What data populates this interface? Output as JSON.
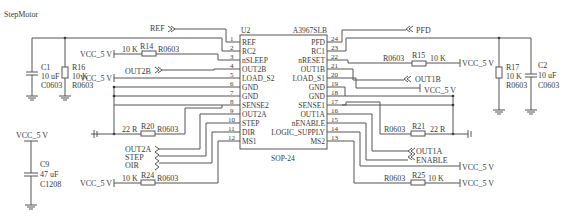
{
  "title": "StepMotor",
  "chip": {
    "ref": "U2",
    "part": "A3967SLB",
    "package": "SOP-24",
    "left_pins": [
      {
        "num": "1",
        "name": "REF"
      },
      {
        "num": "2",
        "name": "RC2"
      },
      {
        "num": "3",
        "name": "nSLEEP"
      },
      {
        "num": "4",
        "name": "OUT2B"
      },
      {
        "num": "5",
        "name": "LOAD_S2"
      },
      {
        "num": "6",
        "name": "GND"
      },
      {
        "num": "7",
        "name": "GND"
      },
      {
        "num": "8",
        "name": "SENSE2"
      },
      {
        "num": "9",
        "name": "OUT2A"
      },
      {
        "num": "10",
        "name": "STEP"
      },
      {
        "num": "11",
        "name": "DIR"
      },
      {
        "num": "12",
        "name": "MS1"
      }
    ],
    "right_pins": [
      {
        "num": "24",
        "name": "PFD"
      },
      {
        "num": "23",
        "name": "RC1"
      },
      {
        "num": "22",
        "name": "nRESET"
      },
      {
        "num": "21",
        "name": "OUT1B"
      },
      {
        "num": "20",
        "name": "LOAD_S1"
      },
      {
        "num": "19",
        "name": "GND"
      },
      {
        "num": "18",
        "name": "GND"
      },
      {
        "num": "17",
        "name": "SENSE1"
      },
      {
        "num": "16",
        "name": "OUT1A"
      },
      {
        "num": "15",
        "name": "nENABLE"
      },
      {
        "num": "14",
        "name": "LOGIC_SUPPLY"
      },
      {
        "num": "13",
        "name": "MS2"
      }
    ]
  },
  "ports": {
    "ref": "REF",
    "out2b": "OUT2B",
    "out2a": "OUT2A",
    "step": "STEP",
    "dir": "OIR",
    "pfd": "PFD",
    "out1b": "OUT1B",
    "out1a": "OUT1A",
    "enable": "ENABLE"
  },
  "power": {
    "vcc": "VCC_5 V"
  },
  "resistors": {
    "r14": {
      "ref": "R14",
      "value": "10 K",
      "pkg": "R0603"
    },
    "r15": {
      "ref": "R15",
      "value": "10 K",
      "pkg": "R0603"
    },
    "r16": {
      "ref": "R16",
      "value": "10 K",
      "pkg": "R0603"
    },
    "r17": {
      "ref": "R17",
      "value": "10 K",
      "pkg": "R0603"
    },
    "r20": {
      "ref": "R20",
      "value": "22 R",
      "pkg": "R0603"
    },
    "r21": {
      "ref": "R21",
      "value": "22 R",
      "pkg": "R0603"
    },
    "r24": {
      "ref": "R24",
      "value": "10 K",
      "pkg": "R0603"
    },
    "r25": {
      "ref": "R25",
      "value": "10 K",
      "pkg": "R0603"
    }
  },
  "capacitors": {
    "c1": {
      "ref": "C1",
      "value": "10 uF",
      "pkg": "C0603"
    },
    "c2": {
      "ref": "C2",
      "value": "10 uF",
      "pkg": "C0603"
    },
    "c9": {
      "ref": "C9",
      "value": "47 uF",
      "pkg": "C1208"
    }
  }
}
